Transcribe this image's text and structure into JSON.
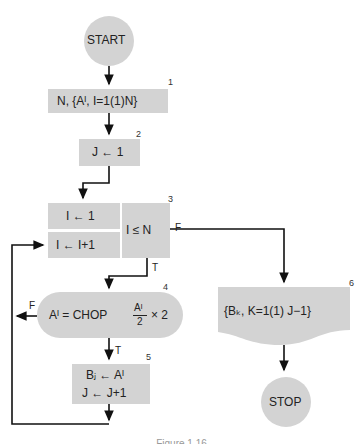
{
  "colors": {
    "fill": "#d3d3d3",
    "line": "#111111",
    "background": "#ffffff"
  },
  "nodes": {
    "start": {
      "label": "START",
      "shape": "circle"
    },
    "n1": {
      "number": "1",
      "label": "N, {Aᴵ, I=1(1)N}",
      "shape": "input"
    },
    "n2": {
      "number": "2",
      "label": "J ← 1",
      "shape": "process"
    },
    "n3_init": {
      "label": "I ← 1"
    },
    "n3_incr": {
      "label": "I ← I+1"
    },
    "n3_test": {
      "number": "3",
      "label": "I ≤ N",
      "true_label": "T",
      "false_label": "F"
    },
    "n4": {
      "number": "4",
      "label_left": "Aᴵ = CHOP",
      "frac_num": "Aᴵ",
      "frac_den": "2",
      "label_right": "× 2",
      "true_label": "T",
      "false_label": "F",
      "shape": "decision-oval"
    },
    "n5": {
      "number": "5",
      "line1": "Bⱼ ← Aᴵ",
      "line2": "J ← J+1",
      "shape": "process"
    },
    "n6": {
      "number": "6",
      "label": "{Bₖ, K=1(1) J−1}",
      "shape": "output-document"
    },
    "stop": {
      "label": "STOP",
      "shape": "circle"
    }
  },
  "caption": "Figure 1.16"
}
